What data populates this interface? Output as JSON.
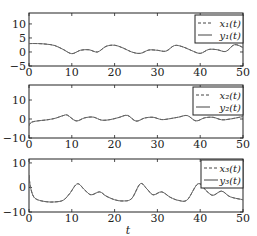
{
  "chart_data": [
    {
      "type": "line",
      "title": "",
      "xlabel": "",
      "ylabel": "",
      "xlim": [
        0,
        50
      ],
      "ylim": [
        -5,
        13.9
      ],
      "xticks": [
        0,
        10,
        20,
        30,
        40,
        50
      ],
      "xtick_labels": [
        "0",
        "10",
        "20",
        "30",
        "40",
        "50"
      ],
      "yticks": [
        -5,
        0,
        5,
        10
      ],
      "ytick_labels": [
        "−5",
        "0",
        "5",
        "10"
      ],
      "grid": false,
      "legend": {
        "placement": "top-right",
        "entries": [
          {
            "label": "x₁(t)",
            "style": "dashed"
          },
          {
            "label": "y₁(t)",
            "style": "solid"
          }
        ]
      },
      "series": [
        {
          "name": "x1(t)",
          "style": "dashed",
          "x": [
            0,
            2,
            4,
            6,
            8,
            10,
            12,
            14,
            16,
            18,
            20,
            22,
            24,
            26,
            28,
            30,
            32,
            34,
            36,
            38,
            40,
            42,
            44,
            46,
            48,
            50
          ],
          "y": [
            3.0,
            3.0,
            2.8,
            2.3,
            0.9,
            -0.6,
            0.6,
            0.8,
            0.0,
            2.0,
            2.4,
            1.4,
            0.0,
            -0.5,
            0.7,
            0.6,
            0.3,
            2.3,
            1.8,
            0.5,
            -0.5,
            0.9,
            0.8,
            0.2,
            2.6,
            1.6
          ]
        },
        {
          "name": "y1(t)",
          "style": "solid",
          "x": [
            0,
            2,
            4,
            6,
            8,
            10,
            12,
            14,
            16,
            18,
            20,
            22,
            24,
            26,
            28,
            30,
            32,
            34,
            36,
            38,
            40,
            42,
            44,
            46,
            48,
            50
          ],
          "y": [
            3.0,
            3.0,
            2.8,
            2.3,
            0.9,
            -0.6,
            0.6,
            0.8,
            0.0,
            2.0,
            2.4,
            1.4,
            0.0,
            -0.5,
            0.7,
            0.6,
            0.3,
            2.3,
            1.8,
            0.5,
            -0.5,
            0.9,
            0.8,
            0.2,
            2.6,
            1.6
          ]
        }
      ]
    },
    {
      "type": "line",
      "title": "",
      "xlabel": "",
      "ylabel": "",
      "xlim": [
        0,
        50
      ],
      "ylim": [
        -10,
        17.9
      ],
      "xticks": [
        0,
        10,
        20,
        30,
        40,
        50
      ],
      "xtick_labels": [
        "0",
        "10",
        "20",
        "30",
        "40",
        "50"
      ],
      "yticks": [
        -10,
        0,
        10
      ],
      "ytick_labels": [
        "−10",
        "0",
        "10"
      ],
      "grid": false,
      "legend": {
        "placement": "top-right",
        "entries": [
          {
            "label": "x₂(t)",
            "style": "dashed"
          },
          {
            "label": "y₂(t)",
            "style": "solid"
          }
        ]
      },
      "series": [
        {
          "name": "x2(t)",
          "style": "dashed",
          "x": [
            0,
            0.5,
            2,
            4,
            6,
            8,
            9,
            11,
            13,
            15,
            17,
            19,
            21,
            23,
            25,
            27,
            29,
            31,
            33,
            35,
            37,
            39,
            41,
            43,
            45,
            47,
            50
          ],
          "y": [
            -3.5,
            -1.8,
            -1.0,
            -0.5,
            0.3,
            1.8,
            2.0,
            -1.0,
            0.6,
            1.0,
            -0.6,
            -0.3,
            0.8,
            1.9,
            -1.1,
            0.5,
            0.9,
            -0.3,
            0.2,
            1.0,
            1.8,
            -1.0,
            0.6,
            0.9,
            -0.4,
            0.0,
            1.3
          ]
        },
        {
          "name": "y2(t)",
          "style": "solid",
          "x": [
            0,
            0.5,
            2,
            4,
            6,
            8,
            9,
            11,
            13,
            15,
            17,
            19,
            21,
            23,
            25,
            27,
            29,
            31,
            33,
            35,
            37,
            39,
            41,
            43,
            45,
            47,
            50
          ],
          "y": [
            -3.5,
            -1.8,
            -1.0,
            -0.5,
            0.3,
            1.8,
            2.0,
            -1.0,
            0.6,
            1.0,
            -0.6,
            -0.3,
            0.8,
            1.9,
            -1.1,
            0.5,
            0.9,
            -0.3,
            0.2,
            1.0,
            1.8,
            -1.0,
            0.6,
            0.9,
            -0.4,
            0.0,
            1.3
          ]
        }
      ]
    },
    {
      "type": "line",
      "title": "",
      "xlabel": "t",
      "ylabel": "",
      "xlim": [
        0,
        50
      ],
      "ylim": [
        -10,
        11.6
      ],
      "xticks": [
        0,
        10,
        20,
        30,
        40,
        50
      ],
      "xtick_labels": [
        "0",
        "10",
        "20",
        "30",
        "40",
        "50"
      ],
      "yticks": [
        -10,
        0,
        10
      ],
      "ytick_labels": [
        "−10",
        "0",
        "10"
      ],
      "grid": false,
      "legend": {
        "placement": "top-right",
        "entries": [
          {
            "label": "x₃(t)",
            "style": "dashed"
          },
          {
            "label": "y₃(t)",
            "style": "solid"
          }
        ]
      },
      "series": [
        {
          "name": "x3(t)",
          "style": "dashed",
          "x": [
            0,
            0.3,
            1,
            2,
            4,
            6,
            8,
            9.5,
            11.3,
            13,
            14.5,
            16.5,
            18,
            20,
            22,
            24,
            26,
            27.5,
            29,
            31,
            33,
            35,
            37,
            39.5,
            41.5,
            43,
            45,
            47,
            50
          ],
          "y": [
            5,
            0.5,
            -3.5,
            -5.0,
            -5.8,
            -5.9,
            -5.2,
            -2.5,
            1.5,
            -1.0,
            -3.0,
            -1.8,
            -3.5,
            -5.0,
            -5.5,
            -4.5,
            1.5,
            -0.5,
            -3.0,
            -1.8,
            -4.0,
            -5.3,
            -5.0,
            1.5,
            -1.5,
            -3.2,
            -1.5,
            -3.8,
            -5.0
          ]
        },
        {
          "name": "y3(t)",
          "style": "solid",
          "x": [
            0,
            0.3,
            1,
            2,
            4,
            6,
            8,
            9.5,
            11.3,
            13,
            14.5,
            16.5,
            18,
            20,
            22,
            24,
            26,
            27.5,
            29,
            31,
            33,
            35,
            37,
            39.5,
            41.5,
            43,
            45,
            47,
            50
          ],
          "y": [
            5,
            0.5,
            -3.5,
            -5.0,
            -5.8,
            -5.9,
            -5.2,
            -2.5,
            1.5,
            -1.0,
            -3.0,
            -1.8,
            -3.5,
            -5.0,
            -5.5,
            -4.5,
            1.5,
            -0.5,
            -3.0,
            -1.8,
            -4.0,
            -5.3,
            -5.0,
            1.5,
            -1.5,
            -3.2,
            -1.5,
            -3.8,
            -5.0
          ]
        }
      ]
    }
  ]
}
